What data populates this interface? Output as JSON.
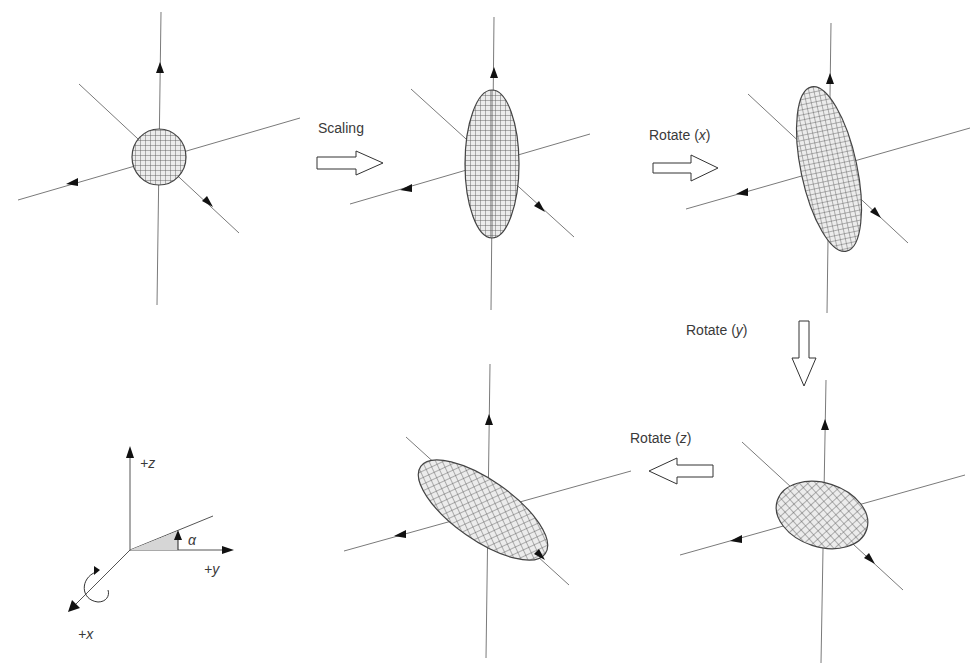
{
  "diagram": {
    "title": "",
    "colors": {
      "axis": "#7a7a7a",
      "mesh": "#555555",
      "mesh_fill": "#e9e9e9",
      "arrowhead": "#111111",
      "text": "#3a3a3a",
      "angle_fill": "#d6d6d6"
    },
    "steps": [
      {
        "id": "sphere",
        "label": "Initial sphere",
        "cx": 159,
        "cy": 157,
        "rx": 27,
        "ry": 28,
        "rotate": 0
      },
      {
        "id": "scaled",
        "label": "After scaling",
        "cx": 492,
        "cy": 164,
        "rx": 27,
        "ry": 74,
        "rotate": 0
      },
      {
        "id": "rotated_x",
        "label": "After rotate x",
        "cx": 829,
        "cy": 169,
        "rx": 28,
        "ry": 84,
        "rotate": -12
      },
      {
        "id": "rotated_y",
        "label": "After rotate y",
        "cx": 822,
        "cy": 515,
        "rx": 47,
        "ry": 32,
        "rotate": 18
      },
      {
        "id": "rotated_z",
        "label": "After rotate z",
        "cx": 483,
        "cy": 510,
        "rx": 76,
        "ry": 30,
        "rotate": 35
      }
    ],
    "transitions": [
      {
        "id": "scaling",
        "label_text": "Scaling",
        "axis": "",
        "direction": "right"
      },
      {
        "id": "rotate_x",
        "label_text": "Rotate (",
        "axis": "x",
        "label_end": ")",
        "direction": "right"
      },
      {
        "id": "rotate_y",
        "label_text": "Rotate (",
        "axis": "y",
        "label_end": ")",
        "direction": "down"
      },
      {
        "id": "rotate_z",
        "label_text": "Rotate (",
        "axis": "z",
        "label_end": ")",
        "direction": "left"
      }
    ],
    "legend": {
      "z_label": "+z",
      "y_label": "+y",
      "x_label": "+x",
      "angle_label": "α"
    }
  }
}
